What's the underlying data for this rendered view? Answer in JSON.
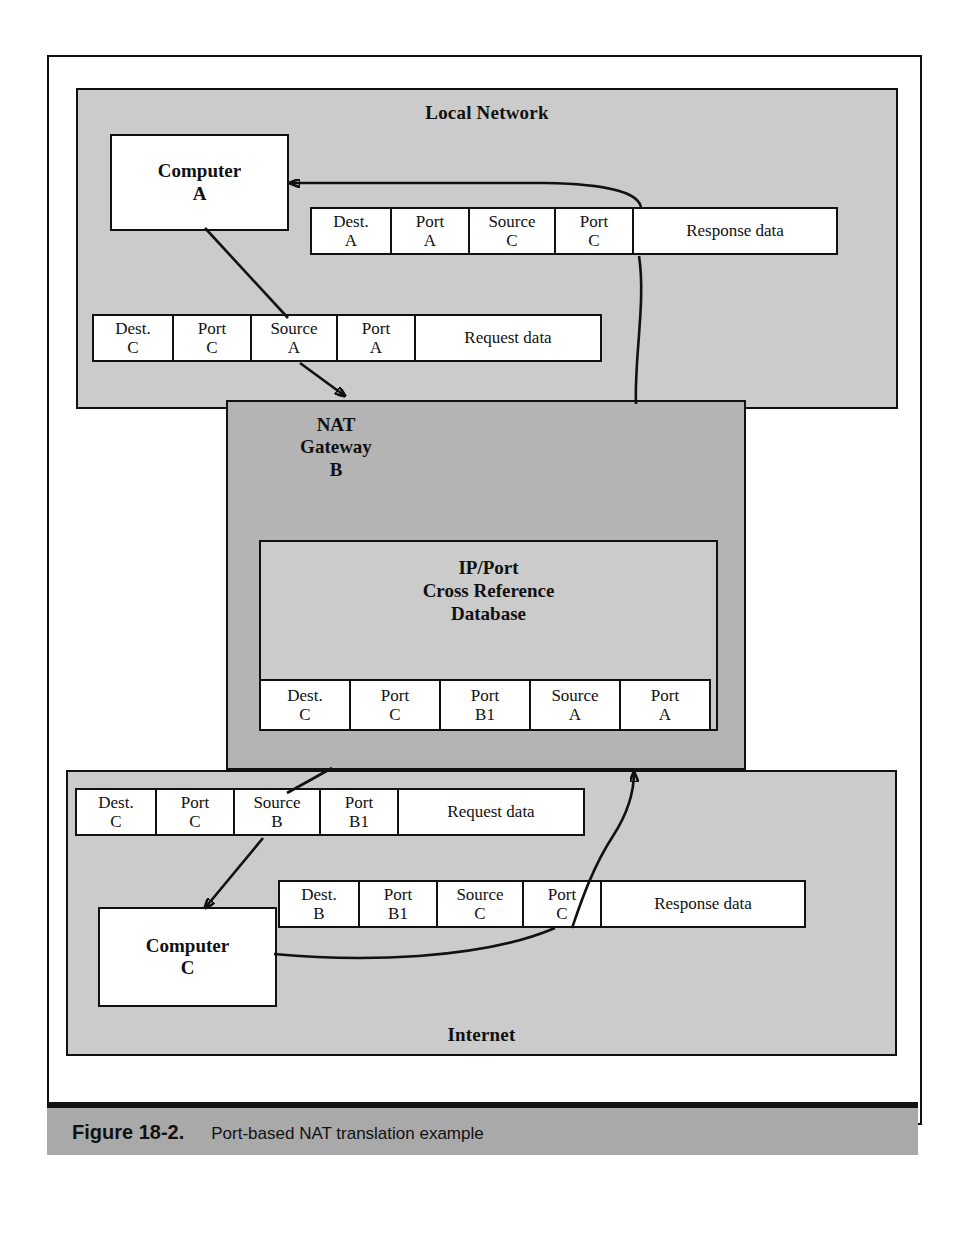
{
  "figure": {
    "number": "Figure 18-2.",
    "caption": "Port-based NAT translation example"
  },
  "zones": {
    "local": {
      "label": "Local Network"
    },
    "internet": {
      "label": "Internet"
    }
  },
  "hosts": {
    "computer_a": {
      "line1": "Computer",
      "line2": "A"
    },
    "computer_c": {
      "line1": "Computer",
      "line2": "C"
    }
  },
  "nat": {
    "title_line1": "NAT",
    "title_line2": "Gateway",
    "title_line3": "B",
    "database": {
      "title_line1": "IP/Port",
      "title_line2": "Cross Reference",
      "title_line3": "Database",
      "row": [
        {
          "label": "Dest.",
          "value": "C"
        },
        {
          "label": "Port",
          "value": "C"
        },
        {
          "label": "Port",
          "value": "B1"
        },
        {
          "label": "Source",
          "value": "A"
        },
        {
          "label": "Port",
          "value": "A"
        }
      ]
    }
  },
  "packets": {
    "local_response": {
      "name": "local-network-response-packet",
      "fields": [
        {
          "label": "Dest.",
          "value": "A"
        },
        {
          "label": "Port",
          "value": "A"
        },
        {
          "label": "Source",
          "value": "C"
        },
        {
          "label": "Port",
          "value": "C"
        }
      ],
      "payload": "Response data"
    },
    "local_request": {
      "name": "local-network-request-packet",
      "fields": [
        {
          "label": "Dest.",
          "value": "C"
        },
        {
          "label": "Port",
          "value": "C"
        },
        {
          "label": "Source",
          "value": "A"
        },
        {
          "label": "Port",
          "value": "A"
        }
      ],
      "payload": "Request data"
    },
    "internet_request": {
      "name": "internet-request-packet",
      "fields": [
        {
          "label": "Dest.",
          "value": "C"
        },
        {
          "label": "Port",
          "value": "C"
        },
        {
          "label": "Source",
          "value": "B"
        },
        {
          "label": "Port",
          "value": "B1"
        }
      ],
      "payload": "Request  data"
    },
    "internet_response": {
      "name": "internet-response-packet",
      "fields": [
        {
          "label": "Dest.",
          "value": "B"
        },
        {
          "label": "Port",
          "value": "B1"
        },
        {
          "label": "Source",
          "value": "C"
        },
        {
          "label": "Port",
          "value": "C"
        }
      ],
      "payload": "Response data"
    }
  },
  "colors": {
    "zone_fill": "#cbcbcb",
    "nat_fill": "#b4b4b4",
    "packet_fill": "#ffffff",
    "stroke": "#111111",
    "caption_bar": "#a9a9a9"
  }
}
